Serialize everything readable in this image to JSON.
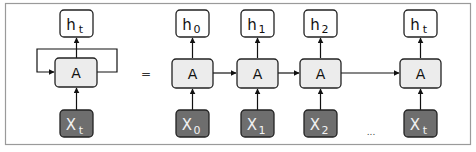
{
  "diagram": {
    "colors": {
      "frame": "#9a9a9a",
      "box_stroke": "#222222",
      "light_box_fill": "#ececec",
      "output_box_fill": "#ffffff",
      "input_box_fill": "#6e6e6e",
      "input_text": "#f2f2f2",
      "text": "#111111"
    },
    "folded": {
      "output": {
        "base": "h",
        "sub": "t"
      },
      "cell": {
        "label": "A"
      },
      "input": {
        "base": "X",
        "sub": "t"
      }
    },
    "equals": "=",
    "unrolled": [
      {
        "output": {
          "base": "h",
          "sub": "0"
        },
        "cell": {
          "label": "A"
        },
        "input": {
          "base": "X",
          "sub": "0"
        }
      },
      {
        "output": {
          "base": "h",
          "sub": "1"
        },
        "cell": {
          "label": "A"
        },
        "input": {
          "base": "X",
          "sub": "1"
        }
      },
      {
        "output": {
          "base": "h",
          "sub": "2"
        },
        "cell": {
          "label": "A"
        },
        "input": {
          "base": "X",
          "sub": "2"
        }
      },
      {
        "output": {
          "base": "h",
          "sub": "t"
        },
        "cell": {
          "label": "A"
        },
        "input": {
          "base": "X",
          "sub": "t"
        }
      }
    ],
    "ellipsis": "..."
  }
}
